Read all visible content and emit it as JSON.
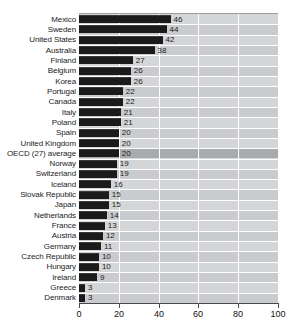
{
  "title_clip": "· · · · · ·",
  "colors": {
    "bar": "#1b1b1b",
    "plot_background": "#d3d5d7",
    "row_alt": "#c9cbce",
    "row_highlight": "#a8abae",
    "gridline": "#ffffff",
    "axis": "#4a4a4a",
    "text": "#1c1c1c"
  },
  "chart_data": {
    "type": "bar",
    "orientation": "horizontal",
    "title": "",
    "xlabel": "",
    "ylabel": "",
    "xlim": [
      0,
      100
    ],
    "xticks": [
      0,
      20,
      40,
      60,
      80,
      100
    ],
    "xtick_labels": [
      "0",
      "20",
      "40",
      "60",
      "80",
      "100"
    ],
    "grid": true,
    "legend": null,
    "highlight_category": "OECD (27) average",
    "categories": [
      "Mexico",
      "Sweden",
      "United States",
      "Australia",
      "Finland",
      "Belgium",
      "Korea",
      "Portugal",
      "Canada",
      "Italy",
      "Poland",
      "Spain",
      "United Kingdom",
      "OECD (27) average",
      "Norway",
      "Switzerland",
      "Iceland",
      "Slovak Republic",
      "Japan",
      "Netherlands",
      "France",
      "Austria",
      "Germany",
      "Czech Republic",
      "Hungary",
      "Ireland",
      "Greece",
      "Denmark"
    ],
    "values": [
      46,
      44,
      42,
      38,
      27,
      26,
      26,
      22,
      22,
      21,
      21,
      20,
      20,
      20,
      19,
      19,
      16,
      15,
      15,
      14,
      13,
      12,
      11,
      10,
      10,
      9,
      3,
      3
    ],
    "value_labels": [
      "46",
      "44",
      "42",
      "38",
      "27",
      "26",
      "26",
      "22",
      "22",
      "21",
      "21",
      "20",
      "20",
      "20",
      "19",
      "19",
      "16",
      "15",
      "15",
      "14",
      "13",
      "12",
      "11",
      "10",
      "10",
      "9",
      "3",
      "3"
    ]
  }
}
